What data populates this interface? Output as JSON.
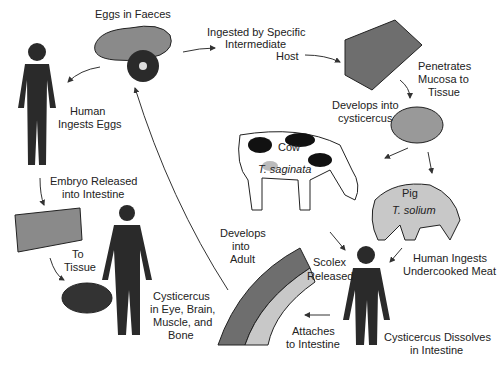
{
  "stages": {
    "eggs_in_faeces": "Eggs in Faeces",
    "ingested_host_1": "Ingested by Specific",
    "ingested_host_2": "Intermediate",
    "ingested_host_3": "Host",
    "penetrates_1": "Penetrates",
    "penetrates_2": "Mucosa to",
    "penetrates_3": "Tissue",
    "develops_cyst_1": "Develops into",
    "develops_cyst_2": "cysticercus",
    "cow": "Cow",
    "t_saginata": "T. saginata",
    "pig": "Pig",
    "t_solium": "T. solium",
    "human_undercooked_1": "Human Ingests",
    "human_undercooked_2": "Undercooked Meat",
    "cyst_dissolves_1": "Cysticercus Dissolves",
    "cyst_dissolves_2": "in Intestine",
    "scolex_1": "Scolex",
    "scolex_2": "Released",
    "attaches_1": "Attaches",
    "attaches_2": "to Intestine",
    "develops_adult_1": "Develops",
    "develops_adult_2": "into",
    "develops_adult_3": "Adult",
    "human_eggs_1": "Human",
    "human_eggs_2": "Ingests Eggs",
    "embryo_1": "Embryo Released",
    "embryo_2": "into Intestine",
    "to_tissue_1": "To",
    "to_tissue_2": "Tissue",
    "cyst_locations_1": "Cysticercus",
    "cyst_locations_2": "in Eye, Brain,",
    "cyst_locations_3": "Muscle, and",
    "cyst_locations_4": "Bone"
  },
  "colors": {
    "silhouette": "#2a2a2a",
    "tissue": "#6e6e6e",
    "light": "#c8c8c8",
    "arrow": "#333333"
  }
}
